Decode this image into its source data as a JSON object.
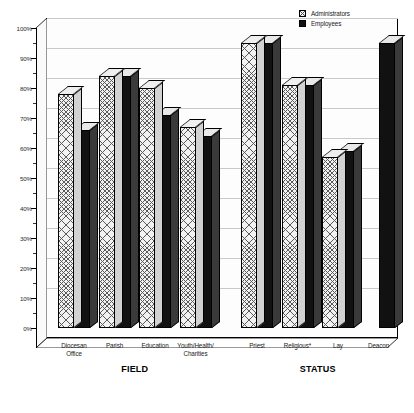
{
  "chart_data": {
    "type": "bar",
    "title": "",
    "subtitle": "",
    "xlabel": "",
    "ylabel": "",
    "ylim": [
      0,
      100
    ],
    "y_unit": "%",
    "grid": true,
    "legend_position": "top-right",
    "style": "3d-clustered-column",
    "y_ticks_major": [
      "0%",
      "10%",
      "20%",
      "30%",
      "40%",
      "50%",
      "60%",
      "70%",
      "80%",
      "90%",
      "100%"
    ],
    "y_tick_values_major": [
      0,
      10,
      20,
      30,
      40,
      50,
      60,
      70,
      80,
      90,
      100
    ],
    "y_tick_values_minor": [
      5,
      15,
      25,
      35,
      45,
      55,
      65,
      75,
      85,
      95
    ],
    "categories": [
      "Diocesan Office",
      "Parish",
      "Education",
      "Youth/Health/ Charities",
      "Priest",
      "Religious*",
      "Lay",
      "Deacon"
    ],
    "category_lines": [
      [
        "Diocesan",
        "Office"
      ],
      [
        "Parish"
      ],
      [
        "Education"
      ],
      [
        "Youth/Health/",
        "Charities"
      ],
      [
        "Priest"
      ],
      [
        "Religious*"
      ],
      [
        "Lay"
      ],
      [
        "Deacon"
      ]
    ],
    "groups": [
      {
        "name": "FIELD",
        "categories": [
          "Diocesan Office",
          "Parish",
          "Education",
          "Youth/Health/Charities"
        ]
      },
      {
        "name": "STATUS",
        "categories": [
          "Priest",
          "Religious*",
          "Lay",
          "Deacon"
        ]
      }
    ],
    "series": [
      {
        "name": "Administrators",
        "fill": "light-crosshatch",
        "color": "#f2f2f2",
        "values": [
          78,
          84,
          80,
          67,
          95,
          81,
          57,
          null
        ]
      },
      {
        "name": "Employees",
        "fill": "solid-black",
        "color": "#111111",
        "values": [
          66,
          84,
          71,
          64,
          95,
          81,
          59,
          95
        ]
      }
    ]
  },
  "legend": {
    "items": [
      {
        "label": "Administrators",
        "swatch": "admin"
      },
      {
        "label": "Employees",
        "swatch": "emp"
      }
    ]
  },
  "axis": {
    "group_labels": [
      "FIELD",
      "STATUS"
    ]
  }
}
